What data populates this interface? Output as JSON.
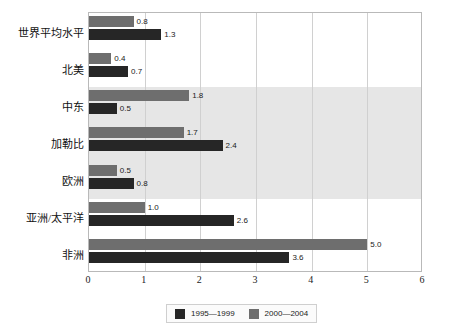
{
  "chart_data": {
    "type": "bar",
    "orientation": "horizontal",
    "title": "",
    "xlabel": "",
    "ylabel": "",
    "xlim": [
      0,
      6
    ],
    "xticks": [
      "0",
      "1",
      "2",
      "3",
      "4",
      "5",
      "6"
    ],
    "grid": true,
    "legend_position": "bottom",
    "categories": [
      "世界平均水平",
      "北美",
      "中东",
      "加勒比",
      "欧洲",
      "亚洲/太平洋",
      "非洲"
    ],
    "series": [
      {
        "name": "1995—1999",
        "color": "#262626",
        "values": [
          1.3,
          0.7,
          0.5,
          2.4,
          0.8,
          2.6,
          3.6
        ],
        "labels": [
          "1.3",
          "0.7",
          "0.5",
          "2.4",
          "0.8",
          "2.6",
          "3.6"
        ]
      },
      {
        "name": "2000—2004",
        "color": "#6e6e6e",
        "values": [
          0.8,
          0.4,
          1.8,
          1.7,
          0.5,
          1.0,
          5.0
        ],
        "labels": [
          "0.8",
          "0.4",
          "1.8",
          "1.7",
          "0.5",
          "1.0",
          "5.0"
        ]
      }
    ],
    "shaded_band_rows": [
      2,
      3,
      4
    ],
    "shaded_band_color": "#e6e6e6"
  },
  "legend": {
    "items": [
      {
        "label": "1995—1999",
        "color": "#262626"
      },
      {
        "label": "2000—2004",
        "color": "#6e6e6e"
      }
    ]
  }
}
